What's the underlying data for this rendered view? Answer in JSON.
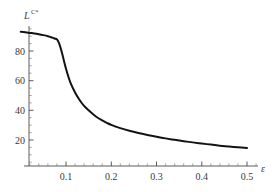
{
  "chart_data": {
    "type": "line",
    "title": "",
    "subtitle": "",
    "xlabel": "ε",
    "ylabel": "L",
    "ylabel_superscript": "C*",
    "ylabel_full": "L^{C*}",
    "xlim": [
      0.0,
      0.52
    ],
    "ylim": [
      0,
      100
    ],
    "xticks": [
      0.1,
      0.2,
      0.3,
      0.4,
      0.5
    ],
    "xtick_labels": [
      "0.1",
      "0.2",
      "0.3",
      "0.4",
      "0.5"
    ],
    "yticks": [
      20,
      40,
      60,
      80
    ],
    "ytick_labels": [
      "20",
      "40",
      "60",
      "80"
    ],
    "x_minor_tick_step": 0.02,
    "y_minor_tick_step": 5,
    "grid": false,
    "legend": null,
    "legend_position": "none",
    "annotations": [],
    "series": [
      {
        "name": "L^{C*}(ε)",
        "color": "#131313",
        "x": [
          0.0,
          0.01,
          0.02,
          0.03,
          0.04,
          0.05,
          0.06,
          0.065,
          0.07,
          0.075,
          0.08,
          0.085,
          0.09,
          0.095,
          0.1,
          0.105,
          0.11,
          0.12,
          0.13,
          0.14,
          0.15,
          0.16,
          0.17,
          0.18,
          0.19,
          0.2,
          0.22,
          0.24,
          0.26,
          0.28,
          0.3,
          0.32,
          0.34,
          0.36,
          0.38,
          0.4,
          0.42,
          0.44,
          0.46,
          0.48,
          0.5
        ],
        "y": [
          93.0,
          92.6,
          92.2,
          91.8,
          91.3,
          90.7,
          90.0,
          89.5,
          89.0,
          88.4,
          87.8,
          85.0,
          80.0,
          74.0,
          68.0,
          63.0,
          58.5,
          52.0,
          47.0,
          43.0,
          40.0,
          37.3,
          35.0,
          33.2,
          31.6,
          30.2,
          28.0,
          26.2,
          24.7,
          23.4,
          22.2,
          21.1,
          20.1,
          19.2,
          18.4,
          17.6,
          16.9,
          16.2,
          15.6,
          15.1,
          14.6
        ]
      }
    ]
  },
  "axes": {
    "x_axis_name": "epsilon-axis",
    "y_axis_name": "L-C-star-axis"
  }
}
